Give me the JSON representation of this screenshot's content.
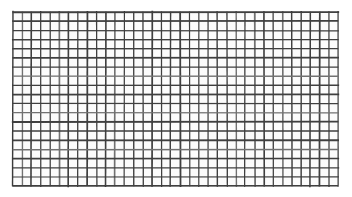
{
  "image": {
    "subject": "wire-mesh-grid",
    "description": "Photograph of a rectangular wire mesh / grid screen, dark lattice on a plain white background",
    "canvas_width": 352,
    "canvas_height": 197,
    "background_color": "#ffffff"
  },
  "grid": {
    "left": 13,
    "top": 12,
    "right": 338,
    "bottom": 186,
    "width": 325,
    "height": 174,
    "columns": 35,
    "rows": 19,
    "cell_pitch_x": 9.29,
    "cell_pitch_y": 9.16,
    "line_color": "#3a3a3a",
    "line_color_light": "#6e6e6e",
    "line_width": 1.5,
    "cell_fill": "#fcfcfc",
    "noise_color": "#d8d8d8"
  },
  "labels": {
    "alt_text": "Close-up photograph of a dark wire mesh grid on white background"
  }
}
